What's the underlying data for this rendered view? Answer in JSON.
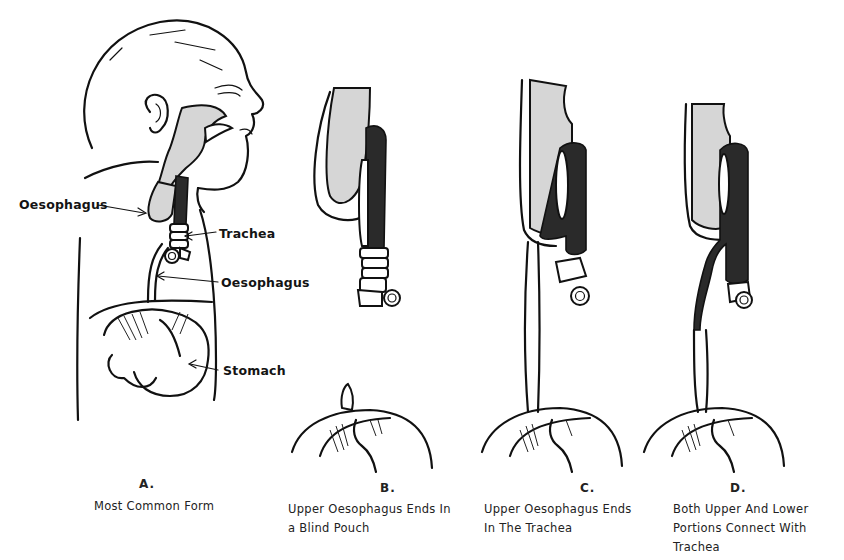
{
  "figure": {
    "panel_a": {
      "letter": "A.",
      "caption_lines": [
        "Most Common Form"
      ],
      "labels": {
        "oesophagus_upper": "Oesophagus",
        "trachea": "Trachea",
        "oesophagus_lower": "Oesophagus",
        "stomach": "Stomach"
      }
    },
    "panel_b": {
      "letter": "B.",
      "caption_lines": [
        "Upper Oesophagus Ends In",
        "a Blind Pouch"
      ]
    },
    "panel_c": {
      "letter": "C.",
      "caption_lines": [
        "Upper Oesophagus Ends",
        "In The Trachea"
      ]
    },
    "panel_d": {
      "letter": "D.",
      "caption_lines": [
        "Both Upper And Lower",
        "Portions Connect With",
        "Trachea"
      ]
    },
    "colors": {
      "ink": "#111111",
      "shade": "#d6d6d6",
      "background": "#ffffff"
    }
  }
}
